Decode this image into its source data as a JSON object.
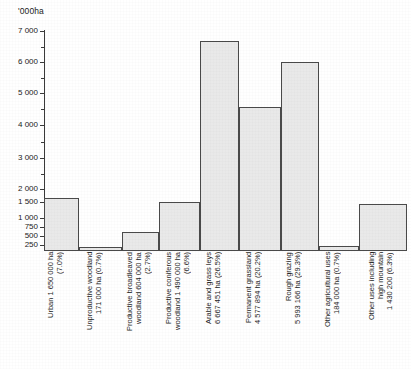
{
  "chart_data": {
    "type": "bar",
    "title": "",
    "subtitle": "",
    "xlabel": "",
    "ylabel": "'000ha",
    "y_axis_unit": "'000ha",
    "y_axis_note": "non-linear (compressed) scale below 1 000",
    "grid": false,
    "legend": "none",
    "orientation": "vertical",
    "bar_fill_color": "#e9e9e9",
    "bar_edge_color": "#4a4a4a",
    "axis_color": "#3a3a3a",
    "ylim": [
      0,
      7000
    ],
    "y_ticks": [
      250,
      500,
      750,
      1000,
      1500,
      2000,
      3000,
      4000,
      5000,
      6000,
      7000
    ],
    "y_tick_labels": [
      "250",
      "500",
      "750",
      "1 000",
      "1 500",
      "2 000",
      "3 000",
      "4 000",
      "5 000",
      "6 000",
      "7 000"
    ],
    "y_minor_ticks": [
      2500,
      3500,
      4500,
      5500,
      6500
    ],
    "categories": [
      "Urban",
      "Unproductive woodland",
      "Productive broadleaved woodland",
      "Productive coniferous woodland",
      "Arable and grass leys",
      "Permanent grassland",
      "Rough grazing",
      "Other agricultural uses",
      "Other uses including high mountain"
    ],
    "values": [
      1650,
      171,
      604,
      1490,
      6667.451,
      4577.894,
      5993.166,
      184,
      1430.2
    ],
    "value_labels": [
      "1 650 000 ha",
      "171 000 ha",
      "604 000 ha",
      "1 490 000 ha",
      "6 667 451 ha",
      "4 577 894 ha",
      "5 993 166 ha",
      "184 000 ha",
      "1 430 200"
    ],
    "percentages": [
      "7.0%",
      "0.7%",
      "2.7%",
      "6.6%",
      "26.5%",
      "20.2%",
      "29.3%",
      "0.7%",
      "6.3%"
    ],
    "tick_labels": [
      "Urban 1 650 000 ha\n(7.0%)",
      "Unproductive woodland\n171 000 ha (0.7%)",
      "Productive broadleaved\nwoodland  604 000 ha\n(2.7%)",
      "Productive  coniferous\nwoodland 1 490 000 ha\n(6.6%)",
      "Arable and grass leys\n6 667 451 ha (26.5%)",
      "Permanent  grassland\n4 577 894 ha (20.2%)",
      "Rough  grazing\n5 993 166 ha (29.3%)",
      "Other agricultural uses\n184 000 ha (0.7%)",
      "Other uses including\nhigh mountain\n1 430 200 (6.3%)"
    ]
  }
}
